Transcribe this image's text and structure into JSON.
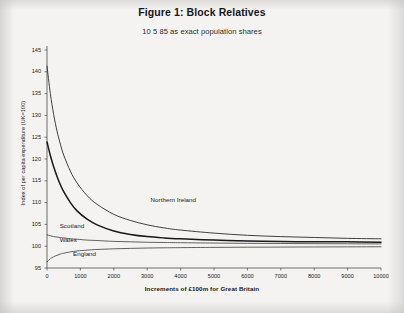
{
  "document": {
    "background_color": "#f4f3f1",
    "ink_color": "#17171a"
  },
  "chart_data": {
    "type": "line",
    "title": "Figure 1: Block Relatives",
    "subtitle": "10 5 85 as exact population shares",
    "xlabel": "Increments of £100m for Great Britain",
    "ylabel": "Index of per capita expenditure (UK=100)",
    "xlim": [
      0,
      10000
    ],
    "ylim": [
      95,
      145
    ],
    "xticks": [
      0,
      1000,
      2000,
      3000,
      4000,
      5000,
      6000,
      7000,
      8000,
      9000,
      10000
    ],
    "yticks": [
      95,
      100,
      105,
      110,
      115,
      120,
      125,
      130,
      135,
      140,
      145
    ],
    "grid": false,
    "legend": "inline-curve-labels",
    "x": [
      0,
      100,
      200,
      300,
      400,
      500,
      700,
      900,
      1200,
      1500,
      2000,
      2500,
      3000,
      3500,
      4000,
      5000,
      6000,
      7000,
      8000,
      9000,
      10000
    ],
    "series": [
      {
        "name": "Northern Ireland",
        "label_x": 3100,
        "label_y": 110.5,
        "stroke": "#2a2a2d",
        "width": 0.9,
        "values": [
          141.3,
          135.0,
          130.2,
          126.4,
          123.4,
          120.9,
          117.2,
          114.5,
          111.6,
          109.6,
          107.3,
          105.9,
          104.9,
          104.2,
          103.7,
          103.0,
          102.5,
          102.2,
          102.0,
          101.8,
          101.7
        ]
      },
      {
        "name": "Scotland",
        "label_x": 380,
        "label_y": 104.6,
        "stroke": "#18181b",
        "width": 1.5,
        "values": [
          123.9,
          120.8,
          118.2,
          116.0,
          114.1,
          112.5,
          110.0,
          108.1,
          106.2,
          104.9,
          103.5,
          102.7,
          102.2,
          101.9,
          101.7,
          101.4,
          101.2,
          101.1,
          101.0,
          101.0,
          100.9
        ]
      },
      {
        "name": "Wales",
        "label_x": 380,
        "label_y": 101.5,
        "stroke": "#3a3a3d",
        "width": 0.8,
        "values": [
          102.6,
          102.4,
          102.2,
          102.1,
          102.0,
          101.9,
          101.7,
          101.6,
          101.4,
          101.3,
          101.1,
          101.0,
          100.9,
          100.85,
          100.8,
          100.72,
          100.66,
          100.62,
          100.58,
          100.55,
          100.52
        ]
      },
      {
        "name": "England",
        "label_x": 780,
        "label_y": 98.3,
        "stroke": "#3a3a3d",
        "width": 0.8,
        "values": [
          96.4,
          97.1,
          97.6,
          97.9,
          98.2,
          98.4,
          98.7,
          98.9,
          99.1,
          99.25,
          99.4,
          99.5,
          99.58,
          99.63,
          99.67,
          99.73,
          99.77,
          99.8,
          99.83,
          99.85,
          99.87
        ]
      }
    ]
  }
}
